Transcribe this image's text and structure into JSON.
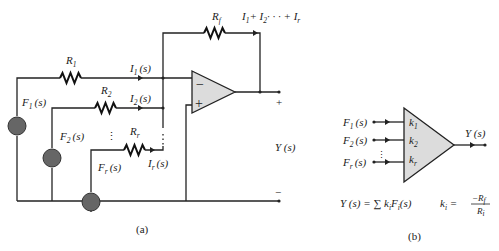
{
  "figure_a": {
    "caption": "(a)",
    "feedback_resistor": "R",
    "feedback_resistor_sub": "f",
    "feedback_current": "I",
    "feedback_current_sub1": "1",
    "feedback_current_plus": "+ I",
    "feedback_current_sub2": "2",
    "feedback_current_dots": "· · ·   + I",
    "feedback_current_subr": "r",
    "resistors": [
      {
        "label": "R",
        "sub": "1"
      },
      {
        "label": "R",
        "sub": "2"
      },
      {
        "label": "R",
        "sub": "r"
      }
    ],
    "currents": [
      {
        "label": "I",
        "sub": "1",
        "arg": "(s)"
      },
      {
        "label": "I",
        "sub": "2",
        "arg": "(s)"
      },
      {
        "label": "I",
        "sub": "r",
        "arg": "(s)"
      }
    ],
    "sources": [
      {
        "label": "F",
        "sub": "1",
        "arg": "(s)"
      },
      {
        "label": "F",
        "sub": "2",
        "arg": "(s)"
      },
      {
        "label": "F",
        "sub": "r",
        "arg": "(s)"
      }
    ],
    "opamp_minus": "−",
    "opamp_plus": "+",
    "output_plus": "+",
    "output_minus": "−",
    "output_label": "Y (s)",
    "ellipsis": "⋮"
  },
  "figure_b": {
    "caption": "(b)",
    "inputs": [
      {
        "label": "F",
        "sub": "1",
        "arg": "(s)"
      },
      {
        "label": "F",
        "sub": "2",
        "arg": "(s)"
      },
      {
        "label": "F",
        "sub": "r",
        "arg": "(s)"
      }
    ],
    "gains": [
      {
        "label": "k",
        "sub": "1"
      },
      {
        "label": "k",
        "sub": "2"
      },
      {
        "label": "k",
        "sub": "r"
      }
    ],
    "output_label": "Y (s)",
    "equation_left": "Y (s)  =  ∑ k",
    "equation_sub_i": "i",
    "equation_mid": "F",
    "equation_tail": "(s)",
    "gain_def_k": "k",
    "gain_def_eq": " = ",
    "gain_def_num": "−R",
    "gain_def_num_sub": "f",
    "gain_def_den": "R",
    "gain_def_den_sub": "i"
  }
}
